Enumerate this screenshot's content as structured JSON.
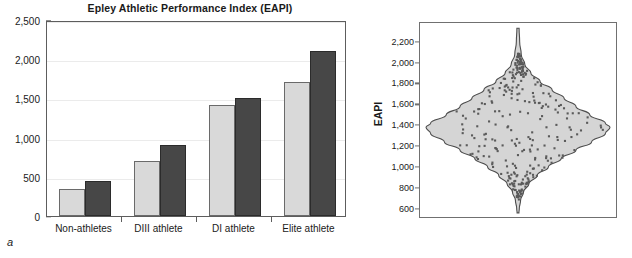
{
  "figure": {
    "panel_a_letter": "a",
    "panel_b_letter": "b"
  },
  "chart_data": [
    {
      "id": "panel-a",
      "type": "bar",
      "title": "Epley Athletic Performance Index (EAPI)",
      "xlabel": "",
      "ylabel": "",
      "categories": [
        "Non-athletes",
        "DIII athlete",
        "DI athlete",
        "Elite athlete"
      ],
      "series": [
        {
          "name": "light-series",
          "color": "#d9d9d9",
          "values": [
            340,
            700,
            1410,
            1710
          ]
        },
        {
          "name": "dark-series",
          "color": "#474747",
          "values": [
            450,
            900,
            1500,
            2100
          ]
        }
      ],
      "ylim": [
        0,
        2500
      ],
      "yticks": [
        0,
        500,
        1000,
        1500,
        2000,
        2500
      ],
      "ytick_labels": [
        "0",
        "500",
        "1,000",
        "1,500",
        "2,000",
        "2,500"
      ],
      "grid": true,
      "legend": "none"
    },
    {
      "id": "panel-b",
      "type": "violin",
      "title": "",
      "xlabel": "",
      "ylabel": "EAPI",
      "ylim": [
        520,
        2380
      ],
      "yticks": [
        600,
        800,
        1000,
        1200,
        1400,
        1600,
        1800,
        2000,
        2200
      ],
      "ytick_labels": [
        "600",
        "800",
        "1,000",
        "1,200",
        "1,400",
        "1,600",
        "1,800",
        "2,000",
        "2,200"
      ],
      "grid": false,
      "legend": "none",
      "fill_color": "#d5d5d5",
      "outline_color": "#4d4d4d",
      "point_color": "#5a5a5a",
      "distribution": {
        "center": 1400,
        "peak_half_width_value": 1.0,
        "widths": [
          {
            "y": 2330,
            "w": 0.012
          },
          {
            "y": 2200,
            "w": 0.018
          },
          {
            "y": 2080,
            "w": 0.035
          },
          {
            "y": 1980,
            "w": 0.075
          },
          {
            "y": 1900,
            "w": 0.14
          },
          {
            "y": 1820,
            "w": 0.24
          },
          {
            "y": 1740,
            "w": 0.37
          },
          {
            "y": 1660,
            "w": 0.5
          },
          {
            "y": 1580,
            "w": 0.63
          },
          {
            "y": 1500,
            "w": 0.78
          },
          {
            "y": 1420,
            "w": 0.95
          },
          {
            "y": 1380,
            "w": 1.0
          },
          {
            "y": 1320,
            "w": 0.95
          },
          {
            "y": 1240,
            "w": 0.8
          },
          {
            "y": 1160,
            "w": 0.63
          },
          {
            "y": 1080,
            "w": 0.47
          },
          {
            "y": 1000,
            "w": 0.33
          },
          {
            "y": 920,
            "w": 0.21
          },
          {
            "y": 840,
            "w": 0.12
          },
          {
            "y": 760,
            "w": 0.06
          },
          {
            "y": 680,
            "w": 0.028
          },
          {
            "y": 600,
            "w": 0.014
          },
          {
            "y": 560,
            "w": 0.01
          }
        ]
      },
      "n_points": 300
    }
  ]
}
